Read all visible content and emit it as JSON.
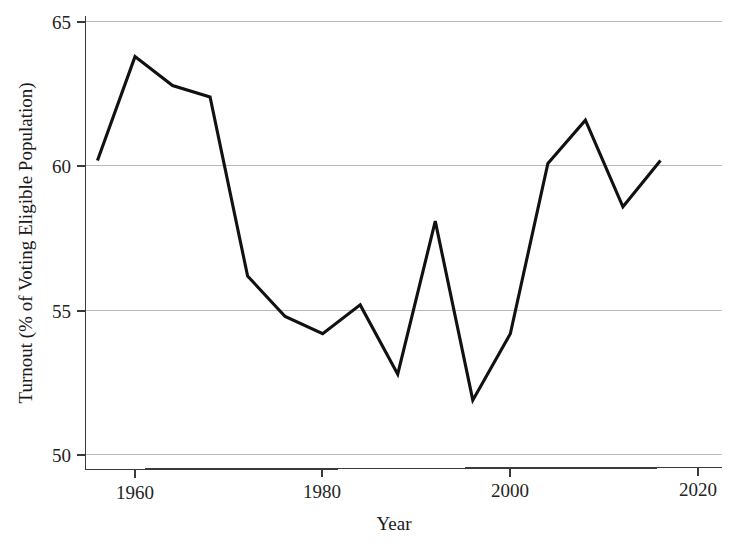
{
  "chart_data": {
    "type": "line",
    "title": "",
    "xlabel": "Year",
    "ylabel": "Turnout (% of Voting Eligible Population)",
    "xlim": [
      1955,
      2021
    ],
    "ylim": [
      49.5,
      65.6
    ],
    "xticks": [
      1960,
      1980,
      2000,
      2020
    ],
    "xtick_labels": [
      "1960",
      "1980",
      "2000",
      "2020"
    ],
    "yticks": [
      50,
      55,
      60,
      65
    ],
    "ytick_labels": [
      "50",
      "55",
      "60",
      "65"
    ],
    "grid": "horizontal",
    "legend": "none",
    "series": [
      {
        "name": "Turnout",
        "color": "#111111",
        "x": [
          1956,
          1960,
          1964,
          1968,
          1972,
          1976,
          1980,
          1984,
          1988,
          1992,
          1996,
          2000,
          2004,
          2008,
          2012,
          2016
        ],
        "values": [
          60.2,
          63.8,
          62.8,
          62.4,
          56.2,
          54.8,
          54.2,
          55.2,
          52.8,
          58.1,
          51.9,
          54.2,
          60.1,
          61.6,
          58.6,
          60.2
        ]
      }
    ]
  },
  "axes": {
    "y_title": "Turnout (% of Voting Eligible Population)",
    "x_title": "Year",
    "y_tick_0": "50",
    "y_tick_1": "55",
    "y_tick_2": "60",
    "y_tick_3": "65",
    "x_tick_0": "1960",
    "x_tick_1": "1980",
    "x_tick_2": "2000",
    "x_tick_3": "2020"
  },
  "colors": {
    "line": "#111111",
    "grid": "#b9b9bc",
    "axis": "#3a3a3a",
    "background": "#ffffff"
  }
}
